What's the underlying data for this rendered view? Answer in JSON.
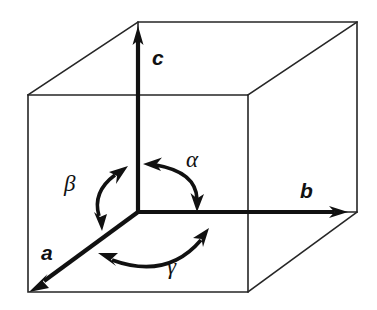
{
  "figure": {
    "kind": "crystal-unit-cell-axes-diagram",
    "background_color": "#ffffff",
    "ink_color": "#111111",
    "cube_edge_color": "#262626"
  },
  "axes": [
    {
      "id": "a",
      "label": "a",
      "direction": "down-left-front",
      "arrowheads": 1
    },
    {
      "id": "b",
      "label": "b",
      "direction": "right",
      "arrowheads": 1
    },
    {
      "id": "c",
      "label": "c",
      "direction": "up",
      "arrowheads": 1
    }
  ],
  "angles": [
    {
      "id": "alpha",
      "label": "α",
      "between": "b and c",
      "arrowheads": 2
    },
    {
      "id": "beta",
      "label": "β",
      "between": "a and c",
      "arrowheads": 2
    },
    {
      "id": "gamma",
      "label": "γ",
      "between": "a and b",
      "arrowheads": 2
    }
  ],
  "geometry": {
    "origin": [
      138,
      212
    ],
    "c_tip": [
      138,
      28
    ],
    "b_tip": [
      347,
      212
    ],
    "a_tip": [
      30,
      290
    ],
    "front_face": {
      "left": 28,
      "right": 248,
      "top": 95,
      "bottom": 292
    },
    "back_face": {
      "left": 138,
      "right": 357,
      "top": 22,
      "bottom": 212
    }
  }
}
